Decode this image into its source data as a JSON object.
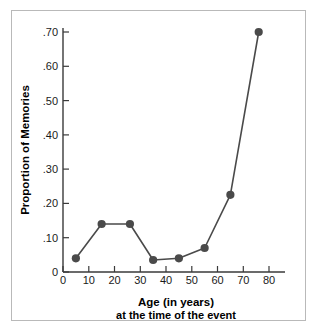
{
  "chart_data": {
    "type": "line",
    "title": "",
    "xlabel": "Age (in years)",
    "xlabel_line2": "at the time of the event",
    "ylabel": "Proportion of Memories",
    "x": [
      5,
      15,
      26,
      35,
      45,
      55,
      65,
      76
    ],
    "values": [
      0.04,
      0.14,
      0.14,
      0.035,
      0.04,
      0.07,
      0.225,
      0.7
    ],
    "series": [
      {
        "name": "Proportion of Memories",
        "values": [
          0.04,
          0.14,
          0.14,
          0.035,
          0.04,
          0.07,
          0.225,
          0.7
        ]
      }
    ],
    "xlim": [
      0,
      80
    ],
    "ylim": [
      0,
      0.72
    ],
    "xticks": [
      0,
      10,
      20,
      30,
      40,
      50,
      60,
      70,
      80
    ],
    "xtick_labels": [
      "0",
      "10",
      "20",
      "30",
      "40",
      "50",
      "60",
      "70",
      "80"
    ],
    "yticks": [
      0,
      0.1,
      0.2,
      0.3,
      0.4,
      0.5,
      0.6,
      0.7
    ],
    "ytick_labels": [
      "0",
      ".10",
      ".20",
      ".30",
      ".40",
      ".50",
      ".60",
      ".70"
    ],
    "grid": false,
    "legend": false,
    "marker": "filled-circle",
    "line_color": "#4a4a4a",
    "marker_color": "#4a4a4a",
    "axis_color": "#3a3a3a",
    "frame_color": "#b9b9b9",
    "background": "#ffffff"
  }
}
